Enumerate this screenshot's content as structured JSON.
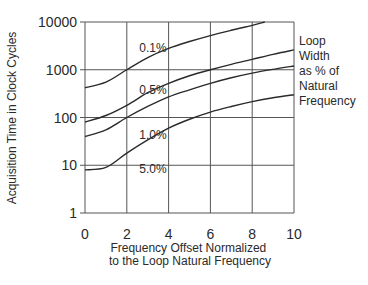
{
  "chart_data": {
    "type": "line",
    "title": "",
    "xlabel": "Frequency Offset Normalized to the Loop Natural Frequency",
    "xlabel_lines": [
      "Frequency Offset Normalized",
      "to the Loop Natural Frequency"
    ],
    "ylabel": "Acquisition Time in Clock Cycles",
    "xlim": [
      0,
      10
    ],
    "ylim": [
      1,
      10000
    ],
    "yscale": "log",
    "grid": true,
    "x_ticks": [
      0,
      2,
      4,
      6,
      8,
      10
    ],
    "x_tick_labels": [
      "0",
      "2",
      "4",
      "6",
      "8",
      "10"
    ],
    "y_ticks": [
      1,
      10,
      100,
      1000,
      10000
    ],
    "y_tick_labels": [
      "1",
      "10",
      "100",
      "1000",
      "10000"
    ],
    "legend_title_lines": [
      "Loop",
      "Width",
      "as % of",
      "Natural",
      "Frequency"
    ],
    "x": [
      0,
      1,
      2,
      3,
      4,
      5,
      6,
      7,
      8,
      9,
      10
    ],
    "series": [
      {
        "name": "0.1%",
        "x": [
          0,
          1,
          2,
          3,
          4,
          5,
          6,
          7,
          8,
          8.6
        ],
        "values": [
          420,
          550,
          1000,
          1800,
          2800,
          3900,
          5200,
          6700,
          8500,
          10000
        ],
        "label_pos": [
          2.6,
          2400
        ]
      },
      {
        "name": "0.5%",
        "values": [
          80,
          110,
          180,
          330,
          520,
          750,
          1000,
          1300,
          1650,
          2100,
          2600
        ],
        "label_pos": [
          2.6,
          310
        ]
      },
      {
        "name": "1.0%",
        "values": [
          40,
          55,
          100,
          170,
          270,
          380,
          520,
          680,
          850,
          1020,
          1200
        ],
        "label_pos": [
          2.6,
          36
        ]
      },
      {
        "name": "5.0%",
        "values": [
          8,
          9,
          18,
          34,
          60,
          92,
          130,
          170,
          215,
          260,
          300
        ],
        "label_pos": [
          2.6,
          7
        ]
      }
    ]
  }
}
